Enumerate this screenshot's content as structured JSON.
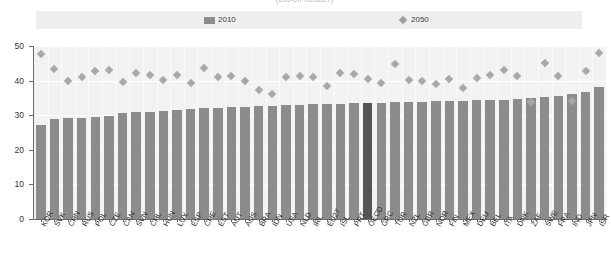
{
  "title": "(cut-off header)",
  "legend": {
    "position": "top",
    "entries": [
      {
        "label": "2010",
        "marker": "bar-swatch",
        "color": "#8c8c8c"
      },
      {
        "label": "2050",
        "marker": "diamond-swatch",
        "color": "#9e9e9e"
      }
    ]
  },
  "axis": {
    "y_ticks": [
      "0",
      "10",
      "20",
      "30",
      "40",
      "50"
    ]
  },
  "colors": {
    "bar": "#8c8c8c",
    "bar_highlight": "#555555",
    "diamond": "#a8a8a8",
    "plot_bg": "#f2f2f2",
    "legend_bg": "#efefef",
    "axis": "#6b6b6b"
  },
  "chart_data": {
    "type": "bar",
    "title": "",
    "xlabel": "",
    "ylabel": "",
    "ylim": [
      0,
      50
    ],
    "grid": true,
    "legend_position": "top",
    "highlight_category": "OECD",
    "categories": [
      "KOR",
      "SVK",
      "CHN",
      "RUS",
      "POL",
      "CZE",
      "CAN",
      "SVN",
      "CHL",
      "HUN",
      "LUX",
      "ESP",
      "CHE",
      "EST",
      "AUT",
      "AUS",
      "BRA",
      "IDN",
      "USA",
      "NLD",
      "IRL",
      "EU27",
      "ISL",
      "PRT",
      "OECD",
      "GRC",
      "TUR",
      "NZL",
      "GBR",
      "NOR",
      "FIN",
      "MEX",
      "DEU",
      "BEL",
      "ITA",
      "DNK",
      "ZAF",
      "SWE",
      "FRA",
      "IND",
      "JPN",
      "ISR"
    ],
    "series": [
      {
        "name": "2010",
        "type": "bar",
        "values": [
          27.2,
          29.0,
          29.2,
          29.3,
          29.4,
          29.8,
          30.6,
          30.8,
          31.0,
          31.2,
          31.5,
          31.8,
          32.0,
          32.2,
          32.3,
          32.5,
          32.6,
          32.8,
          32.9,
          33.0,
          33.1,
          33.2,
          33.3,
          33.4,
          33.5,
          33.6,
          33.7,
          33.8,
          33.9,
          34.0,
          34.1,
          34.2,
          34.3,
          34.4,
          34.5,
          34.7,
          34.9,
          35.3,
          35.6,
          36.0,
          36.8,
          38.2
        ]
      },
      {
        "name": "2050",
        "type": "scatter",
        "marker": "diamond",
        "values": [
          47.6,
          43.3,
          40.0,
          41.1,
          42.8,
          43.2,
          39.7,
          42.3,
          41.7,
          40.2,
          41.5,
          39.3,
          43.7,
          40.9,
          41.3,
          39.8,
          37.4,
          36.0,
          41.0,
          41.2,
          41.1,
          38.3,
          42.3,
          41.8,
          40.6,
          39.3,
          44.8,
          40.3,
          39.8,
          38.9,
          40.5,
          38.0,
          40.8,
          41.6,
          43.0,
          41.3,
          33.7,
          45.0,
          41.2,
          34.2,
          42.9,
          48.1
        ]
      }
    ]
  }
}
